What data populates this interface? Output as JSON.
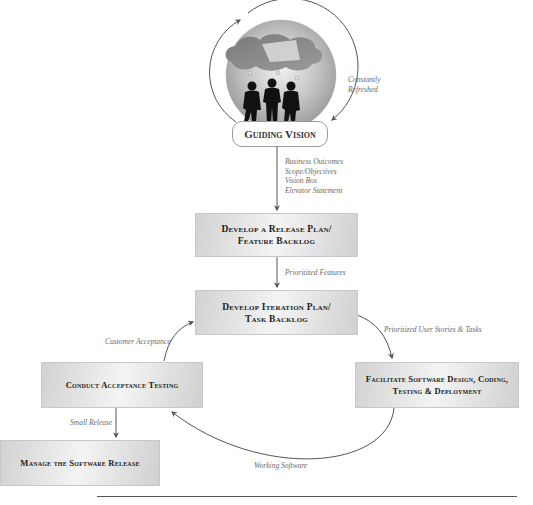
{
  "vision": {
    "label": "Guiding Vision",
    "cycle_label_line1": "Constantly",
    "cycle_label_line2": "Refreshed",
    "outputs": [
      "Business Outcomes",
      "Scope/Objectives",
      "Vision Box",
      "Elevator Statement"
    ]
  },
  "boxes": {
    "release_plan": {
      "line1": "Develop a Release Plan/",
      "line2": "Feature Backlog"
    },
    "iteration_plan": {
      "line1": "Develop Iteration Plan/",
      "line2": "Task Backlog"
    },
    "facilitate": {
      "line1": "Facilitate Software Design, Coding,",
      "line2": "Testing & Deployment"
    },
    "acceptance": {
      "line1": "Conduct Acceptance Testing"
    },
    "manage_release": {
      "line1": "Manage the Software Release"
    }
  },
  "flows": {
    "prioritized_features": "Prioritized Features",
    "prioritized_stories": "Prioritized User Stories & Tasks",
    "working_software": "Working Software",
    "customer_acceptance": "Customer Acceptance",
    "small_release": "Small Release"
  },
  "colors": {
    "arrow": "#555555",
    "box_border": "#c8c8c8",
    "label_text": "#6a6a6a",
    "circle_fill": "#b4b4b4",
    "cloud_fill": "#8a8a8a"
  }
}
